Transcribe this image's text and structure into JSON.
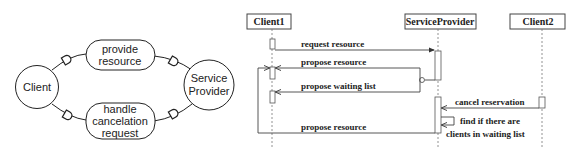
{
  "left_diagram": {
    "nodes": [
      {
        "id": "client",
        "label": "Client",
        "shape": "circle"
      },
      {
        "id": "service_provider",
        "label_lines": [
          "Service",
          "Provider"
        ],
        "shape": "circle"
      }
    ],
    "processes": [
      {
        "id": "provide_resource",
        "label_lines": [
          "provide",
          "resource"
        ],
        "shape": "pill"
      },
      {
        "id": "handle_cancelation",
        "label_lines": [
          "handle",
          "cancelation",
          "request"
        ],
        "shape": "pill"
      }
    ],
    "connector_icon": "d-shaped-port-icon"
  },
  "sequence_diagram": {
    "lifelines": [
      {
        "id": "client1",
        "label": "Client1"
      },
      {
        "id": "service_provider",
        "label": "ServiceProvider"
      },
      {
        "id": "client2",
        "label": "Client2"
      }
    ],
    "messages": [
      {
        "from": "Client1",
        "to": "ServiceProvider",
        "label": "request resource"
      },
      {
        "from": "ServiceProvider",
        "to": "Client1",
        "label": "propose resource"
      },
      {
        "from": "ServiceProvider",
        "to": "Client1",
        "label": "propose waiting list"
      },
      {
        "from": "Client2",
        "to": "ServiceProvider",
        "label": "cancel reservation"
      },
      {
        "from": "ServiceProvider",
        "to": "ServiceProvider",
        "label_lines": [
          "find if there are",
          "clients in waiting list"
        ]
      },
      {
        "from": "ServiceProvider",
        "to": "Client1",
        "label": "propose resource"
      }
    ]
  }
}
